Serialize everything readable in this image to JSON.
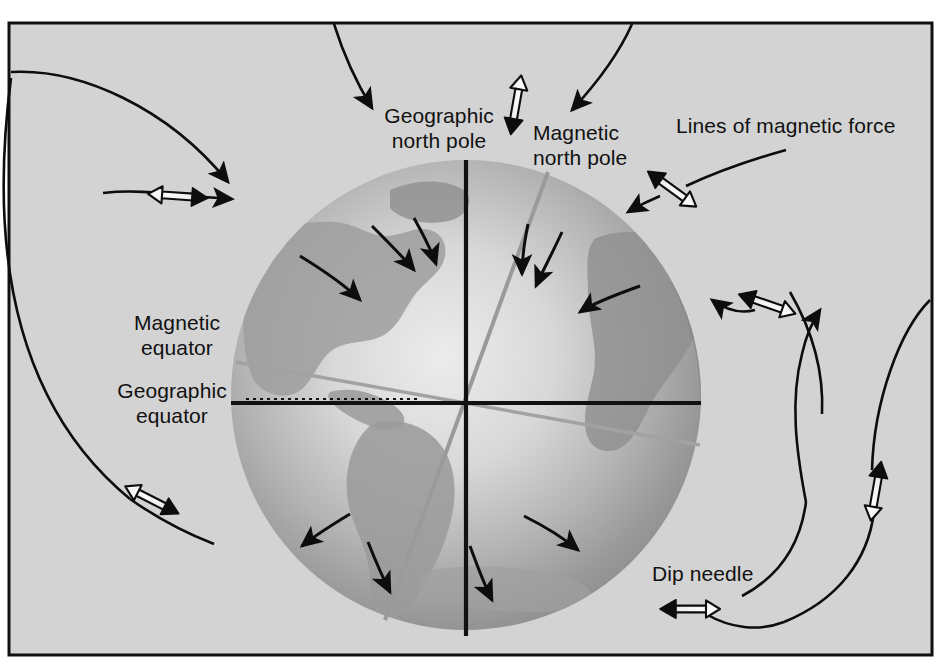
{
  "figure": {
    "background_color": "#d2d2d2",
    "frame_color": "#101010",
    "globe_light_color": "#e8e8e8",
    "globe_mid_color": "#b0b0b0",
    "globe_dark_color": "#8a8a8a",
    "field_line_color": "#0d0d0d",
    "needle_body_color": "#f6f6f6",
    "needle_outline_color": "#0d0d0d",
    "magnetic_axis_color": "#9a9a9a"
  },
  "labels": {
    "geographic_north_pole": "Geographic\nnorth pole",
    "magnetic_north_pole": "Magnetic\nnorth pole",
    "lines_of_magnetic_force": "Lines of magnetic force",
    "magnetic_equator": "Magnetic\nequator",
    "geographic_equator": "Geographic\nequator",
    "dip_needle": "Dip needle"
  },
  "elements": {
    "globe": {
      "name": "earth-globe",
      "center_x": 466,
      "center_y": 395,
      "radius": 235
    },
    "geographic_axis": {
      "name": "geographic-axis-line",
      "x": 466,
      "y_top": 160,
      "y_bottom": 634,
      "color": "#111111"
    },
    "geographic_equator_line": {
      "name": "geographic-equator-line",
      "x_left": 231,
      "x_right": 701,
      "y": 403,
      "color": "#111111"
    },
    "magnetic_axis": {
      "name": "magnetic-axis-line",
      "x_top": 548,
      "y_top": 172,
      "x_bottom": 385,
      "y_bottom": 620,
      "color": "#9a9a9a"
    },
    "magnetic_equator_line": {
      "name": "magnetic-equator-line",
      "x_left": 236,
      "y_left": 362,
      "x_right": 700,
      "y_right": 445,
      "color": "#9a9a9a"
    }
  },
  "dip_needles": [
    {
      "name": "dip-needle-upper-left",
      "x": 178,
      "y": 196,
      "angle": 4
    },
    {
      "name": "dip-needle-lower-left",
      "x": 152,
      "y": 500,
      "angle": 27
    },
    {
      "name": "dip-needle-top-center",
      "x": 516,
      "y": 105,
      "angle": 100
    },
    {
      "name": "dip-needle-upper-right",
      "x": 672,
      "y": 189,
      "angle": 216
    },
    {
      "name": "dip-needle-mid-right",
      "x": 767,
      "y": 304,
      "angle": 199
    },
    {
      "name": "dip-needle-far-right",
      "x": 876,
      "y": 491,
      "angle": 280
    },
    {
      "name": "dip-needle-bottom-right",
      "x": 690,
      "y": 609,
      "angle": 180
    }
  ],
  "field_line_count": 6,
  "globe_arrow_count": 10
}
